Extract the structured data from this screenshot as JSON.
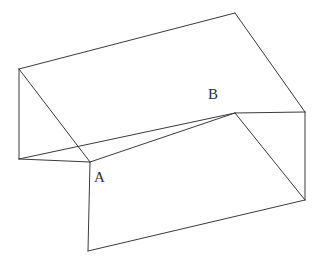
{
  "figure": {
    "type": "line-drawing",
    "background_color": "#ffffff",
    "stroke_color": "#3b3b40",
    "stroke_width": 1,
    "width": 320,
    "height": 267
  },
  "labels": {
    "a": "A",
    "b": "B"
  },
  "geometry": {
    "vertices": {
      "top_back_left": [
        19,
        69
      ],
      "top_back_right": [
        235,
        13
      ],
      "top_front_right": [
        305,
        112
      ],
      "top_front_left": [
        19,
        159
      ],
      "rim_back_left": [
        88,
        143
      ],
      "rim_back_right": [
        235,
        113
      ],
      "rim_front_left": [
        90,
        162
      ],
      "bottom_front": [
        88,
        251
      ],
      "bottom_right": [
        305,
        200
      ]
    },
    "edges": [
      [
        "top_back_left",
        "top_back_right"
      ],
      [
        "top_back_right",
        "top_front_right"
      ],
      [
        "top_front_right",
        "rim_back_right"
      ],
      [
        "top_back_left",
        "top_front_left"
      ],
      [
        "top_front_left",
        "rim_front_left"
      ],
      [
        "top_back_left",
        "rim_front_left"
      ],
      [
        "rim_front_left",
        "rim_back_right"
      ],
      [
        "top_front_left",
        "rim_back_left"
      ],
      [
        "rim_back_left",
        "rim_back_right"
      ],
      [
        "rim_front_left",
        "bottom_front"
      ],
      [
        "bottom_front",
        "bottom_right"
      ],
      [
        "bottom_right",
        "top_front_right"
      ],
      [
        "rim_back_right",
        "bottom_right"
      ]
    ],
    "label_anchors": {
      "a": [
        90,
        162
      ],
      "b": [
        235,
        113
      ]
    }
  }
}
